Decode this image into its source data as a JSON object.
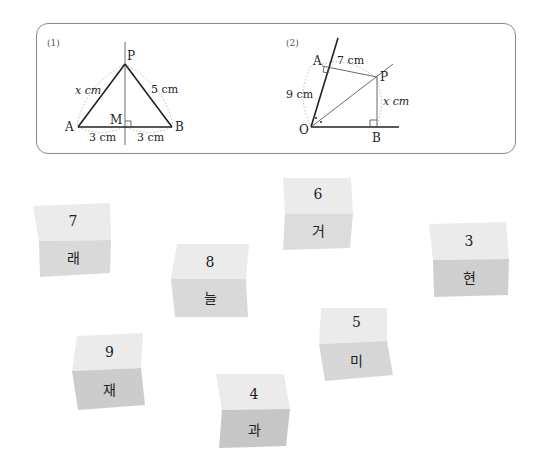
{
  "problems": [
    {
      "label": "(1)",
      "points": {
        "P": "P",
        "A": "A",
        "B": "B",
        "M": "M"
      },
      "lengths": {
        "PA": "x cm",
        "PB": "5 cm",
        "AM": "3 cm",
        "MB": "3 cm"
      }
    },
    {
      "label": "(2)",
      "points": {
        "A": "A",
        "P": "P",
        "O": "O",
        "B": "B"
      },
      "lengths": {
        "AP": "7 cm",
        "OA": "9 cm",
        "PB": "x cm"
      }
    }
  ],
  "cards": [
    {
      "number": "7",
      "word": "래"
    },
    {
      "number": "6",
      "word": "거"
    },
    {
      "number": "8",
      "word": "늘"
    },
    {
      "number": "3",
      "word": "현"
    },
    {
      "number": "9",
      "word": "재"
    },
    {
      "number": "5",
      "word": "미"
    },
    {
      "number": "4",
      "word": "과"
    }
  ],
  "colors": {
    "card_top": "#ebebeb",
    "card_bottom": "#d6d6d6",
    "card_bottom_dark": "#c4c4c4",
    "box_border": "#8a8a8a"
  }
}
